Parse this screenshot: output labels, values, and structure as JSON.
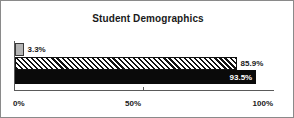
{
  "chart_data": {
    "type": "bar",
    "orientation": "horizontal",
    "title": "Student Demographics",
    "xlabel": "",
    "ylabel": "",
    "xlim": [
      0,
      100
    ],
    "grid": false,
    "legend": null,
    "tick_labels": [
      "0%",
      "50%",
      "100%"
    ],
    "tick_values": [
      0,
      50,
      100
    ],
    "categories": [
      "series-1",
      "series-2",
      "series-3"
    ],
    "values": [
      3.3,
      85.9,
      93.5
    ],
    "bars": [
      {
        "value": 3.3,
        "label": "3.3%",
        "fill": "gray",
        "label_color": "#1a1a1a",
        "label_position": "outside"
      },
      {
        "value": 85.9,
        "label": "85.9%",
        "fill": "hatched",
        "label_color": "#1a1a1a",
        "label_position": "outside"
      },
      {
        "value": 93.5,
        "label": "93.5%",
        "fill": "black",
        "label_color": "#ffffff",
        "label_position": "inside"
      }
    ],
    "colors": {
      "gray": "#b4b4b4",
      "hatch_line": "#111111",
      "black": "#0a0a0a",
      "axis": "#5a5a5a",
      "border": "#8a8a8a",
      "background": "#ffffff",
      "text": "#1a1a1a"
    }
  },
  "axis": {
    "tick_0_label": "0%",
    "tick_50_label": "50%",
    "tick_100_label": "100%"
  }
}
